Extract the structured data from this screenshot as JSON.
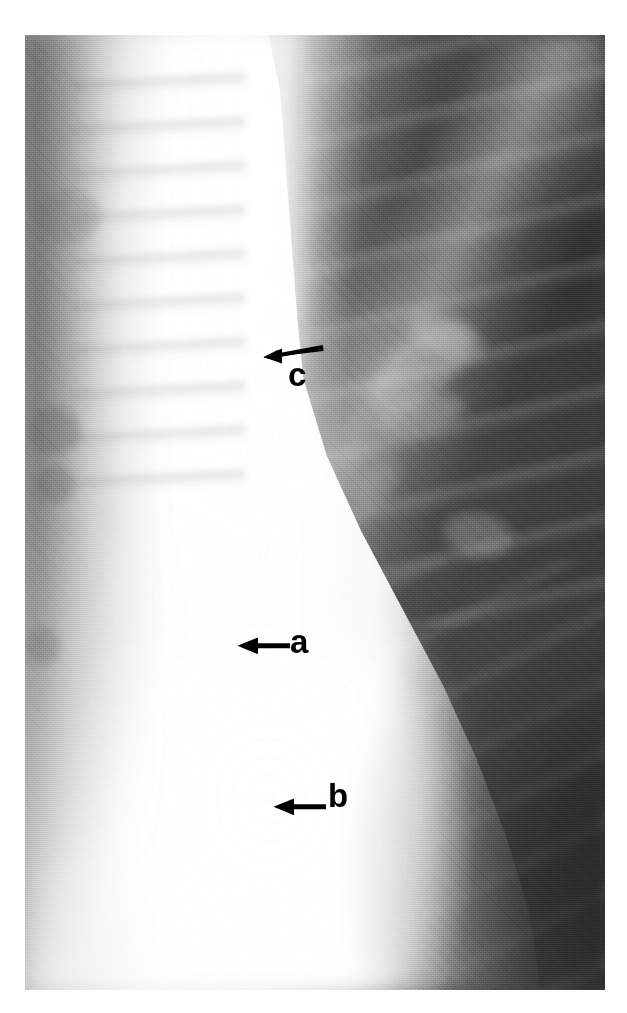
{
  "figure": {
    "type": "radiograph",
    "modality": "chest x-ray",
    "view": "frontal mediastinal close-up",
    "canvas": {
      "width": 627,
      "height": 1013,
      "background": "#ffffff"
    },
    "plate": {
      "x": 25,
      "y": 35,
      "width": 580,
      "height": 955
    },
    "palette": {
      "film_white": "#ffffff",
      "mediastinum_bright": "#f2f2f2",
      "soft_tissue_mid": "#a5a5a5",
      "lung_dark": "#454545",
      "lung_darkest": "#343434",
      "annotation_black": "#000000"
    }
  },
  "annotations": [
    {
      "id": "c",
      "name": "annotation-arrow-c",
      "label": "c",
      "arrow_direction": "left",
      "label_position": "below-right-of-arrow",
      "tip": {
        "x": 265,
        "y": 356
      },
      "tail": {
        "x": 322,
        "y": 347
      }
    },
    {
      "id": "a",
      "name": "annotation-arrow-a",
      "label": "a",
      "arrow_direction": "left",
      "label_position": "right-of-arrow",
      "tip": {
        "x": 239,
        "y": 645
      },
      "tail": {
        "x": 288,
        "y": 645
      }
    },
    {
      "id": "b",
      "name": "annotation-arrow-b",
      "label": "b",
      "arrow_direction": "left",
      "label_position": "right-of-arrow",
      "tip": {
        "x": 275,
        "y": 805
      },
      "tail": {
        "x": 325,
        "y": 805
      }
    }
  ]
}
